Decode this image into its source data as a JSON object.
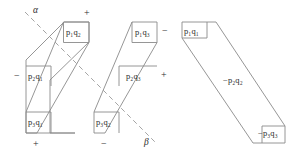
{
  "figure": {
    "type": "diagram",
    "stroke_color": "#8a8a8a",
    "text_color": "#2b2b2b",
    "background": "#ffffff",
    "left_panel": {
      "name": "left-figure",
      "axis_labels": {
        "alpha": "α",
        "beta": "β"
      },
      "terms": [
        {
          "id": "t1",
          "text": "p₁q₂",
          "p": "p",
          "p_sub": "1",
          "q": "q",
          "q_sub": "2",
          "band": "band-a"
        },
        {
          "id": "t2",
          "text": "p₂q₁",
          "p": "p",
          "p_sub": "2",
          "q": "q",
          "q_sub": "1",
          "band": "band-a"
        },
        {
          "id": "t3",
          "text": "p₃q₁",
          "p": "p",
          "p_sub": "3",
          "q": "q",
          "q_sub": "1",
          "band": "band-a"
        },
        {
          "id": "t4",
          "text": "p₁q₃",
          "p": "p",
          "p_sub": "1",
          "q": "q",
          "q_sub": "3",
          "band": "band-b"
        },
        {
          "id": "t5",
          "text": "p₂q₃",
          "p": "p",
          "p_sub": "2",
          "q": "q",
          "q_sub": "3",
          "band": "band-b"
        },
        {
          "id": "t6",
          "text": "p₃q₂",
          "p": "p",
          "p_sub": "3",
          "q": "q",
          "q_sub": "2",
          "band": "band-b"
        }
      ],
      "signs": [
        {
          "id": "s1",
          "text": "+",
          "position": "top-center"
        },
        {
          "id": "s2",
          "text": "−",
          "position": "right-of-p1q3"
        },
        {
          "id": "s3",
          "text": "−",
          "position": "left-of-p2q1"
        },
        {
          "id": "s4",
          "text": "+",
          "position": "right-of-p2q3"
        },
        {
          "id": "s5",
          "text": "+",
          "position": "below-p3q1"
        },
        {
          "id": "s6",
          "text": "−",
          "position": "below-p3q2"
        }
      ]
    },
    "right_panel": {
      "name": "right-figure",
      "terms": [
        {
          "id": "r1",
          "text": "p₁q₁",
          "sign": "",
          "p_sub": "1",
          "q_sub": "1"
        },
        {
          "id": "r2",
          "text": "−p₂q₂",
          "sign": "−",
          "p_sub": "2",
          "q_sub": "2"
        },
        {
          "id": "r3",
          "text": "−p₃q₃",
          "sign": "−",
          "p_sub": "3",
          "q_sub": "3"
        }
      ]
    }
  }
}
